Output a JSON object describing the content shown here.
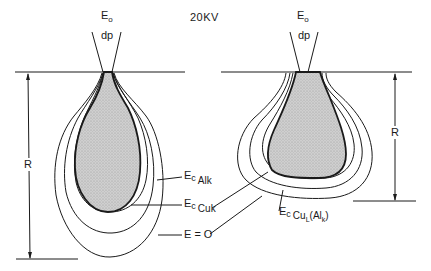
{
  "figure": {
    "voltage_label": "20KV",
    "left": {
      "beam_label": "E",
      "beam_label_sub": "o",
      "beam_dp": "dp",
      "range_label": "R",
      "contours": [
        {
          "label_main": "E",
          "label_sub1": "c",
          "label_sub2": "Alk",
          "label_full": "Ec Alk"
        },
        {
          "label_main": "E",
          "label_sub1": "c",
          "label_sub2": "Cuk",
          "label_full": "Ec Cuk"
        },
        {
          "label_full": "E = O",
          "label_main": "E = O"
        }
      ]
    },
    "right": {
      "beam_label": "E",
      "beam_label_sub": "o",
      "beam_dp": "dp",
      "range_label": "R",
      "contour_label": {
        "main": "E",
        "sub1": "c",
        "sub2": "Cu",
        "sub3": "L",
        "paren": "(Al",
        "paren_sub": "k",
        "paren_close": ")",
        "full": "Ec CuL(Alk)"
      }
    },
    "colors": {
      "line": "#1a1a1a",
      "fill": "#c8c8c8",
      "background": "#ffffff"
    }
  }
}
